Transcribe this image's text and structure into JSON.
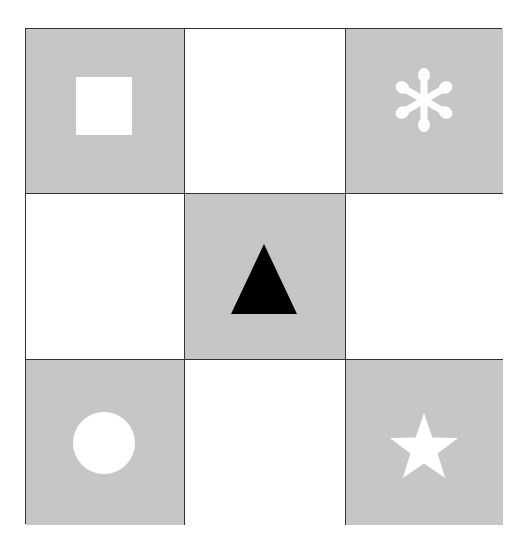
{
  "diagram": {
    "title": "",
    "grid": {
      "rows": 3,
      "cols": 3,
      "colors": {
        "gray": "#c6c6c6",
        "white": "#ffffff",
        "line": "#333333",
        "shape_light": "#ffffff",
        "shape_dark": "#000000"
      },
      "cells": [
        {
          "row": 0,
          "col": 0,
          "fill": "gray",
          "shape": "square",
          "shape_color": "#ffffff"
        },
        {
          "row": 0,
          "col": 1,
          "fill": "white",
          "shape": "none"
        },
        {
          "row": 0,
          "col": 2,
          "fill": "gray",
          "shape": "asterisk",
          "shape_color": "#ffffff"
        },
        {
          "row": 1,
          "col": 0,
          "fill": "white",
          "shape": "none"
        },
        {
          "row": 1,
          "col": 1,
          "fill": "gray",
          "shape": "triangle",
          "shape_color": "#000000"
        },
        {
          "row": 1,
          "col": 2,
          "fill": "white",
          "shape": "none"
        },
        {
          "row": 2,
          "col": 0,
          "fill": "gray",
          "shape": "circle",
          "shape_color": "#ffffff"
        },
        {
          "row": 2,
          "col": 1,
          "fill": "white",
          "shape": "none"
        },
        {
          "row": 2,
          "col": 2,
          "fill": "gray",
          "shape": "star",
          "shape_color": "#ffffff"
        }
      ]
    }
  }
}
